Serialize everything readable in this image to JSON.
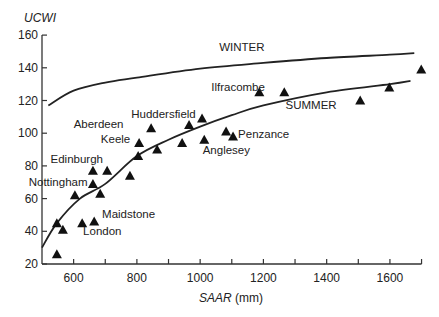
{
  "chart_data": {
    "type": "scatter",
    "title": "",
    "xlabel_italic": "SAAR",
    "xlabel_unit": " (mm)",
    "ylabel": "UCWI",
    "xlim": [
      500,
      1700
    ],
    "ylim": [
      20,
      160
    ],
    "x_ticks": [
      600,
      800,
      1000,
      1200,
      1400,
      1600
    ],
    "x_minor_ticks": [
      600,
      700,
      800,
      900,
      1000,
      1100,
      1200,
      1300,
      1400,
      1500,
      1600,
      1700
    ],
    "y_ticks": [
      20,
      40,
      60,
      80,
      100,
      120,
      140,
      160
    ],
    "grid": false,
    "points": [
      {
        "x": 547,
        "y": 26
      },
      {
        "x": 547,
        "y": 45
      },
      {
        "x": 566,
        "y": 41
      },
      {
        "x": 604,
        "y": 62
      },
      {
        "x": 627,
        "y": 45
      },
      {
        "x": 665,
        "y": 46
      },
      {
        "x": 661,
        "y": 77
      },
      {
        "x": 706,
        "y": 77
      },
      {
        "x": 661,
        "y": 69
      },
      {
        "x": 684,
        "y": 63
      },
      {
        "x": 778,
        "y": 74
      },
      {
        "x": 804,
        "y": 86
      },
      {
        "x": 807,
        "y": 94
      },
      {
        "x": 845,
        "y": 103
      },
      {
        "x": 864,
        "y": 90
      },
      {
        "x": 943,
        "y": 94
      },
      {
        "x": 965,
        "y": 105
      },
      {
        "x": 1006,
        "y": 109
      },
      {
        "x": 1013,
        "y": 96
      },
      {
        "x": 1082,
        "y": 101
      },
      {
        "x": 1104,
        "y": 98
      },
      {
        "x": 1187,
        "y": 125
      },
      {
        "x": 1266,
        "y": 125
      },
      {
        "x": 1506,
        "y": 120
      },
      {
        "x": 1598,
        "y": 128
      },
      {
        "x": 1699,
        "y": 139
      }
    ],
    "point_labels": [
      {
        "text": "Ilfracombe",
        "x": 1035,
        "y": 126
      },
      {
        "text": "Huddersfield",
        "x": 782,
        "y": 109
      },
      {
        "text": "Aberdeen",
        "x": 600,
        "y": 103
      },
      {
        "text": "Keele",
        "x": 686,
        "y": 94
      },
      {
        "text": "Edinburgh",
        "x": 527,
        "y": 82
      },
      {
        "text": "Nottingham",
        "x": 458,
        "y": 68
      },
      {
        "text": "Penzance",
        "x": 1120,
        "y": 97
      },
      {
        "text": "Anglesey",
        "x": 1008,
        "y": 87
      },
      {
        "text": "Maidstone",
        "x": 690,
        "y": 48
      },
      {
        "text": "London",
        "x": 630,
        "y": 38
      }
    ],
    "series": [
      {
        "name": "WINTER",
        "type": "line",
        "x": [
          520,
          600,
          700,
          800,
          1000,
          1200,
          1400,
          1600,
          1677
        ],
        "y": [
          117,
          126,
          131,
          134,
          139.5,
          143,
          146,
          148,
          149
        ]
      },
      {
        "name": "SUMMER",
        "type": "line",
        "x": [
          500,
          547,
          620,
          700,
          800,
          900,
          1000,
          1100,
          1200,
          1400,
          1600,
          1665
        ],
        "y": [
          30,
          45,
          60,
          69,
          86,
          96,
          104,
          111,
          117,
          125,
          130,
          132
        ]
      }
    ],
    "curve_labels": [
      {
        "text": "WINTER",
        "x": 1060,
        "y": 150
      },
      {
        "text": "SUMMER",
        "x": 1270,
        "y": 115
      }
    ]
  }
}
